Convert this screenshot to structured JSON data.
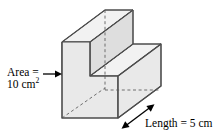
{
  "figure": {
    "area_label": {
      "line1": "Area =",
      "line2_value": "10 cm",
      "line2_exponent": "2"
    },
    "length_label": "Length = 5 cm",
    "colors": {
      "face_fill": "#e9e9e9",
      "face_fill_light": "#f2f2f2",
      "face_fill_dark": "#dedede",
      "edge_stroke": "#4d4d4d",
      "hidden_edge_stroke": "#6e6e6e",
      "arrow_stroke": "#000000",
      "text": "#000000",
      "background": "#ffffff"
    }
  }
}
